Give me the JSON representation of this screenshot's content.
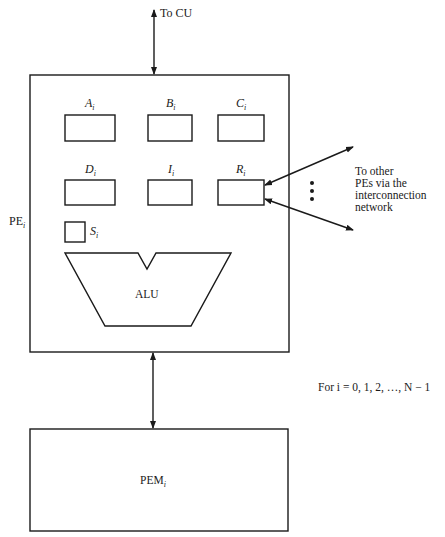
{
  "diagram": {
    "to_cu": "To CU",
    "pe": {
      "name": "PE",
      "subscript": "i"
    },
    "registers": [
      {
        "name": "A",
        "subscript": "i"
      },
      {
        "name": "B",
        "subscript": "i"
      },
      {
        "name": "C",
        "subscript": "i"
      },
      {
        "name": "D",
        "subscript": "i"
      },
      {
        "name": "I",
        "subscript": "i"
      },
      {
        "name": "R",
        "subscript": "i"
      }
    ],
    "status": {
      "name": "S",
      "subscript": "i"
    },
    "alu": "ALU",
    "network_note": [
      "To other",
      "PEs via the",
      "interconnection",
      "network"
    ],
    "ellipsis": "⋮",
    "pem": {
      "name": "PEM",
      "subscript": "i"
    },
    "range_note": "For i = 0, 1, 2, …, N − 1"
  }
}
